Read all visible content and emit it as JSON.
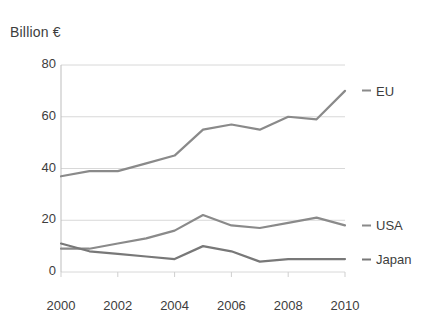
{
  "chart_data": {
    "type": "line",
    "title": "Billion €",
    "xlabel": "",
    "ylabel": "Billion €",
    "x": [
      2000,
      2001,
      2002,
      2003,
      2004,
      2005,
      2006,
      2007,
      2008,
      2009,
      2010
    ],
    "categories": [
      "2000",
      "2001",
      "2002",
      "2003",
      "2004",
      "2005",
      "2006",
      "2007",
      "2008",
      "2009",
      "2010"
    ],
    "xtick_labels": [
      "2000",
      "2002",
      "2004",
      "2006",
      "2008",
      "2010"
    ],
    "ytick_labels": [
      "0",
      "20",
      "40",
      "60",
      "80"
    ],
    "yticks": [
      0,
      20,
      40,
      60,
      80
    ],
    "xlim": [
      2000,
      2010
    ],
    "ylim": [
      0,
      80
    ],
    "grid": true,
    "legend_position": "right",
    "line_color": "#8a8a8a",
    "series": [
      {
        "name": "EU",
        "color": "#8a8a8a",
        "values": [
          37,
          39,
          39,
          42,
          45,
          55,
          57,
          55,
          60,
          59,
          70
        ]
      },
      {
        "name": "USA",
        "color": "#8a8a8a",
        "values": [
          9,
          9,
          11,
          13,
          16,
          22,
          18,
          17,
          19,
          21,
          18
        ]
      },
      {
        "name": "Japan",
        "color": "#787878",
        "values": [
          11,
          8,
          7,
          6,
          5,
          10,
          8,
          4,
          5,
          5,
          5
        ]
      }
    ]
  },
  "legend": {
    "items": [
      {
        "label": "EU",
        "value_at_end": 70
      },
      {
        "label": "USA",
        "value_at_end": 18
      },
      {
        "label": "Japan",
        "value_at_end": 5
      }
    ]
  }
}
